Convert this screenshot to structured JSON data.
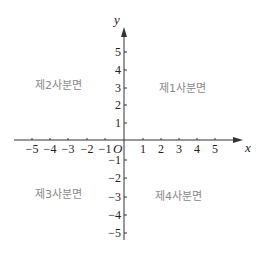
{
  "diagram": {
    "type": "coordinate-plane",
    "axes": {
      "x_label": "x",
      "y_label": "y",
      "origin_label": "O",
      "x_ticks": [
        {
          "value": -5,
          "label": "−5",
          "px": 32
        },
        {
          "value": -4,
          "label": "−4",
          "px": 50
        },
        {
          "value": -3,
          "label": "−3",
          "px": 68
        },
        {
          "value": -2,
          "label": "−2",
          "px": 87
        },
        {
          "value": -1,
          "label": "−1",
          "px": 105
        },
        {
          "value": 1,
          "label": "1",
          "px": 143
        },
        {
          "value": 2,
          "label": "2",
          "px": 161
        },
        {
          "value": 3,
          "label": "3",
          "px": 179
        },
        {
          "value": 4,
          "label": "4",
          "px": 197
        },
        {
          "value": 5,
          "label": "5",
          "px": 215
        }
      ],
      "y_ticks": [
        {
          "value": 5,
          "label": "5",
          "px": 52
        },
        {
          "value": 4,
          "label": "4",
          "px": 70
        },
        {
          "value": 3,
          "label": "3",
          "px": 88
        },
        {
          "value": 2,
          "label": "2",
          "px": 105
        },
        {
          "value": 1,
          "label": "1",
          "px": 123
        },
        {
          "value": -1,
          "label": "−1",
          "px": 160
        },
        {
          "value": -2,
          "label": "−2",
          "px": 178
        },
        {
          "value": -3,
          "label": "−3",
          "px": 197
        },
        {
          "value": -4,
          "label": "−4",
          "px": 215
        },
        {
          "value": -5,
          "label": "−5",
          "px": 233
        }
      ]
    },
    "quadrants": {
      "q1": "제1사분면",
      "q2": "제2사분면",
      "q3": "제3사분면",
      "q4": "제4사분면"
    },
    "colors": {
      "axis": "#333333",
      "text": "#222222",
      "quadrant_label": "#8a8a8a"
    }
  }
}
